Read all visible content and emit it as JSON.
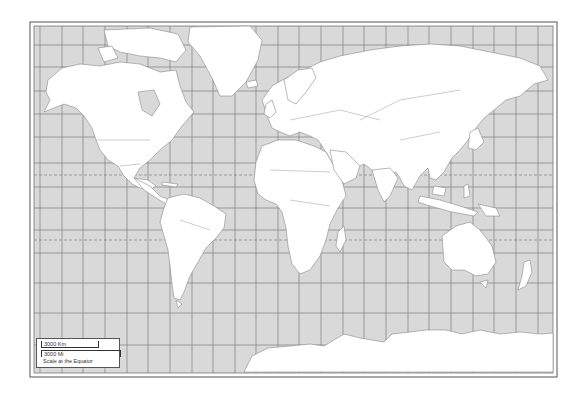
{
  "map": {
    "title": "World Map (Mercator)",
    "colors": {
      "ocean": "#d9d9d9",
      "land": "#ffffff",
      "grid": "#6f6f6f",
      "border": "#8a8a8a",
      "frame": "#555555"
    },
    "frame": {
      "outer": [
        30,
        22,
        557,
        377
      ],
      "inner": [
        34,
        26,
        553,
        373
      ]
    },
    "grid": {
      "verticals_x": [
        40,
        62,
        83,
        105,
        127,
        148,
        170,
        192,
        213,
        235,
        256,
        278,
        299,
        321,
        343,
        364,
        386,
        408,
        429,
        451,
        473,
        494,
        516,
        538
      ],
      "horizontals_y": [
        45,
        67,
        91,
        114,
        137,
        163,
        187,
        208,
        230,
        253,
        283,
        313,
        345
      ],
      "dashed_y": [
        175,
        240
      ]
    }
  },
  "legend": {
    "km_label": "3000 Km",
    "mi_label": "3000 Mi",
    "caption": "Scale at the Equator"
  }
}
